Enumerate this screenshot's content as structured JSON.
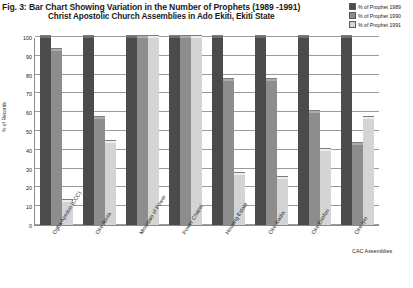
{
  "header": {
    "title": "Fig. 3: Bar Chart Showing Variation in the Number of Prophets (1989 -1991)",
    "subtitle": "Christ Apostolic Church Assemblies in Ado Ekiti, Ekiti State"
  },
  "legend": {
    "position": "top-right",
    "entries": [
      {
        "label": "% of Prophet 1989",
        "color": "#4b4b4b"
      },
      {
        "label": "% of Prophet 1990",
        "color": "#8d8d8d"
      },
      {
        "label": "% of Prophet 1991",
        "color": "#d4d4d4"
      }
    ]
  },
  "chart_data": {
    "type": "bar",
    "title": "Fig. 3: Bar Chart Showing Variation in the Number of Prophets (1989 -1991)",
    "subtitle": "Christ Apostolic Church Assemblies in Ado Ekiti, Ekiti State",
    "xlabel": "CAC Assemblies",
    "ylabel": "% of Records",
    "ylim": [
      0,
      100
    ],
    "yticks": [
      0,
      10,
      20,
      30,
      40,
      50,
      60,
      70,
      80,
      90,
      100
    ],
    "grid": true,
    "categories": [
      "Ogba Ayedun (CCC)",
      "Oke Itunla",
      "Mountain of Power",
      "Power Chapel",
      "Housing Estate",
      "Oke Ibadia",
      "Oke Erinfon",
      "Oke Iyin"
    ],
    "series": [
      {
        "name": "% of Prophet 1989",
        "color": "#4b4b4b",
        "values": [
          100,
          100,
          100,
          100,
          100,
          100,
          100,
          100
        ]
      },
      {
        "name": "% of Prophet 1990",
        "color": "#8d8d8d",
        "values": [
          93,
          57,
          100,
          100,
          77,
          77,
          60,
          43
        ]
      },
      {
        "name": "% of Prophet 1991",
        "color": "#d4d4d4",
        "values": [
          13,
          44,
          100,
          100,
          27,
          25,
          40,
          57
        ]
      }
    ]
  }
}
